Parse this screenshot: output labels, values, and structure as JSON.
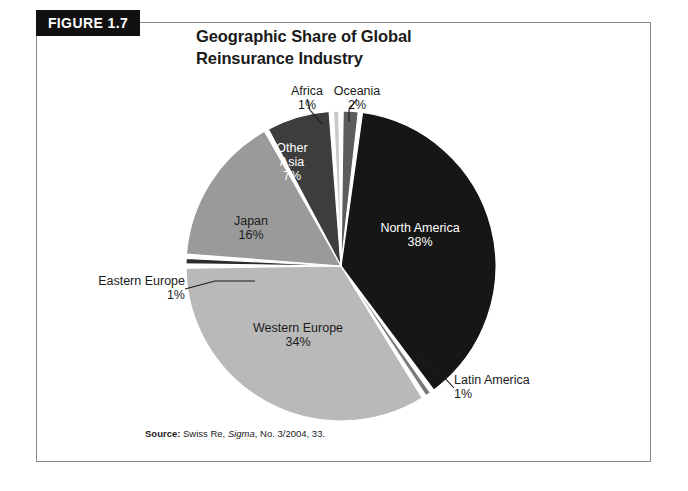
{
  "figure": {
    "tab_label": "FIGURE 1.7",
    "title_line1": "Geographic Share of Global",
    "title_line2": "Reinsurance Industry"
  },
  "source": {
    "label": "Source:",
    "text_before": " Swiss Re, ",
    "italic": "Sigma",
    "text_after": ", No. 3/2004, 33."
  },
  "colors": {
    "black_slice": "#161616",
    "dark_gray_slice": "#3d3d3d",
    "mid_dark_gray_slice": "#5c5c5c",
    "mid_gray_slice": "#7a7a7a",
    "gray_slice": "#9a9a9a",
    "light_gray_slice": "#b9b9b9",
    "very_light_gray_slice": "#c9c9c9",
    "gap": "#ffffff",
    "text_dark": "#1b1b1b",
    "text_light": "#ffffff",
    "frame_border": "#8a8a8a",
    "tab_background": "#111111"
  },
  "chart_data": {
    "type": "pie",
    "title": "Geographic Share of Global Reinsurance Industry",
    "xlabel": "",
    "ylabel": "",
    "grid": false,
    "legend_position": "none",
    "value_unit": "percent",
    "labels_on_slices": true,
    "start_angle_deg": 0,
    "direction": "clockwise",
    "categories": [
      "Oceania",
      "North America",
      "Latin America",
      "Western Europe",
      "Eastern Europe",
      "Japan",
      "Other Asia",
      "Africa"
    ],
    "values": [
      2,
      38,
      1,
      34,
      1,
      16,
      7,
      1
    ],
    "slices": [
      {
        "name": "Oceania",
        "value": 2,
        "label": "Oceania",
        "value_label": "2%",
        "color": "#5c5c5c",
        "label_placement": "outside-callout",
        "label_text_color": "#1b1b1b"
      },
      {
        "name": "North America",
        "value": 38,
        "label": "North America",
        "value_label": "38%",
        "color": "#161616",
        "label_placement": "inside",
        "label_text_color": "#ffffff"
      },
      {
        "name": "Latin America",
        "value": 1,
        "label": "Latin America",
        "value_label": "1%",
        "color": "#7a7a7a",
        "label_placement": "outside-callout",
        "label_text_color": "#1b1b1b"
      },
      {
        "name": "Western Europe",
        "value": 34,
        "label": "Western Europe",
        "value_label": "34%",
        "color": "#b9b9b9",
        "label_placement": "inside",
        "label_text_color": "#1b1b1b"
      },
      {
        "name": "Eastern Europe",
        "value": 1,
        "label": "Eastern Europe",
        "value_label": "1%",
        "color": "#2b2b2b",
        "label_placement": "outside-callout",
        "label_text_color": "#1b1b1b"
      },
      {
        "name": "Japan",
        "value": 16,
        "label": "Japan",
        "value_label": "16%",
        "color": "#9a9a9a",
        "label_placement": "inside",
        "label_text_color": "#1b1b1b"
      },
      {
        "name": "Other Asia",
        "value": 7,
        "label": "Other Asia",
        "label_line1": "Other",
        "label_line2": "Asia",
        "value_label": "7%",
        "color": "#3d3d3d",
        "label_placement": "inside",
        "label_text_color": "#ffffff"
      },
      {
        "name": "Africa",
        "value": 1,
        "label": "Africa",
        "value_label": "1%",
        "color": "#c9c9c9",
        "label_placement": "outside-callout",
        "label_text_color": "#1b1b1b"
      }
    ]
  }
}
